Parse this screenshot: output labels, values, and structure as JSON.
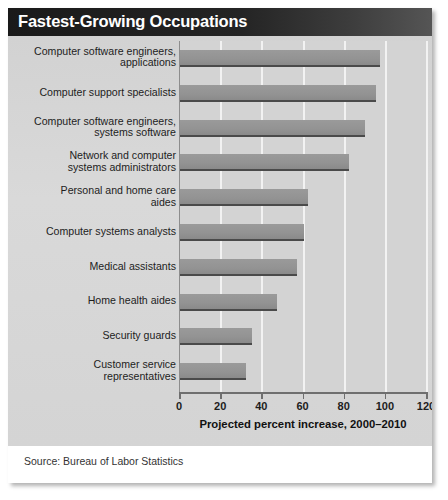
{
  "card": {
    "title": "Fastest-Growing Occupations",
    "source": "Source: Bureau of Labor Statistics"
  },
  "colors": {
    "title_bar_dark": "#1a1a1a",
    "title_text": "#ffffff",
    "panel_bg": "#d6d6d6",
    "plot_bg": "#d3d3d3",
    "gridline": "#f2f2f2",
    "bar_fill": "#939393",
    "bar_shadow": "#4a4a4a",
    "axis": "#6f6f6f",
    "text": "#1d1d1d"
  },
  "chart_data": {
    "type": "bar",
    "orientation": "horizontal",
    "title": "Fastest-Growing Occupations",
    "xlabel": "Projected percent increase, 2000–2010",
    "ylabel": "",
    "xlim": [
      0,
      120
    ],
    "xticks": [
      0,
      20,
      40,
      60,
      80,
      100,
      120
    ],
    "xtick_labels": [
      "0",
      "20",
      "40",
      "60",
      "80",
      "100",
      "120"
    ],
    "grid": true,
    "grid_axis": "x",
    "legend": false,
    "source": "Source: Bureau of Labor Statistics",
    "categories": [
      "Computer software engineers, applications",
      "Computer support specialists",
      "Computer software engineers, systems software",
      "Network and computer systems administrators",
      "Personal and home care aides",
      "Computer systems analysts",
      "Medical assistants",
      "Home health aides",
      "Security guards",
      "Customer service representatives"
    ],
    "category_lines": [
      [
        "Computer software engineers,",
        "applications"
      ],
      [
        "Computer support specialists"
      ],
      [
        "Computer software engineers,",
        "systems software"
      ],
      [
        "Network and computer",
        "systems administrators"
      ],
      [
        "Personal and home care",
        "aides"
      ],
      [
        "Computer systems analysts"
      ],
      [
        "Medical assistants"
      ],
      [
        "Home health aides"
      ],
      [
        "Security guards"
      ],
      [
        "Customer service",
        "representatives"
      ]
    ],
    "values": [
      97,
      95,
      90,
      82,
      62,
      60,
      57,
      47,
      35,
      32
    ],
    "units": "percent"
  }
}
